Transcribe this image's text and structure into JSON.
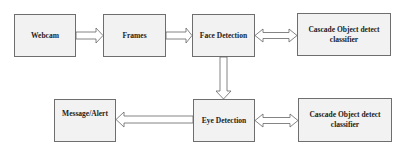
{
  "diagram": {
    "nodes": [
      {
        "id": "webcam",
        "label": "Webcam"
      },
      {
        "id": "frames",
        "label": "Frames"
      },
      {
        "id": "face_detection",
        "label": "Face Detection"
      },
      {
        "id": "cascade_face",
        "label": "Cascade Object detect classifier"
      },
      {
        "id": "eye_detection",
        "label": "Eye Detection"
      },
      {
        "id": "cascade_eye",
        "label": "Cascade Object detect classifier"
      },
      {
        "id": "message_alert",
        "label": "Message/Alert"
      }
    ],
    "edges": [
      {
        "from": "webcam",
        "to": "frames",
        "type": "single"
      },
      {
        "from": "frames",
        "to": "face_detection",
        "type": "single"
      },
      {
        "from": "face_detection",
        "to": "cascade_face",
        "type": "bidirectional"
      },
      {
        "from": "face_detection",
        "to": "eye_detection",
        "type": "single"
      },
      {
        "from": "eye_detection",
        "to": "cascade_eye",
        "type": "bidirectional"
      },
      {
        "from": "eye_detection",
        "to": "message_alert",
        "type": "single"
      }
    ]
  },
  "colors": {
    "box_fill": "#f2f2f2",
    "box_border": "#6e6e6e",
    "arrow_fill": "#ffffff",
    "arrow_stroke": "#666666",
    "text": "#222222"
  }
}
